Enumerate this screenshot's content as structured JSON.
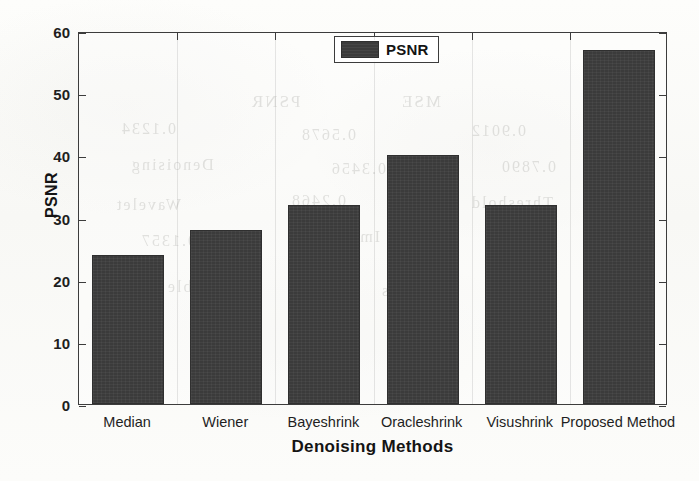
{
  "chart_data": {
    "type": "bar",
    "title": "",
    "xlabel": "Denoising Methods",
    "ylabel": "PSNR",
    "categories": [
      "Median",
      "Wiener",
      "Bayeshrink",
      "Oracleshrink",
      "Visushrink",
      "Proposed Method"
    ],
    "values": [
      24,
      28,
      32,
      40,
      32,
      57
    ],
    "series": [
      {
        "name": "PSNR",
        "values": [
          24,
          28,
          32,
          40,
          32,
          57
        ],
        "color": "#3b3b3b"
      }
    ],
    "ylim": [
      0,
      60
    ],
    "yticks": [
      0,
      10,
      20,
      30,
      40,
      50,
      60
    ],
    "ytick_labels": [
      "0",
      "10",
      "20",
      "30",
      "40",
      "50",
      "60"
    ],
    "grid": "vertical-light",
    "legend": {
      "position": "top-center",
      "entries": [
        {
          "label": "PSNR",
          "color": "#3b3b3b"
        }
      ]
    }
  },
  "legend": {
    "label": "PSNR"
  },
  "axes": {
    "x_title": "Denoising Methods",
    "y_title": "PSNR"
  },
  "background_bleed": [
    {
      "text": "PSNR",
      "x": 250,
      "y": 92,
      "size": 17
    },
    {
      "text": "MSE",
      "x": 400,
      "y": 92,
      "size": 17
    },
    {
      "text": "0.1234",
      "x": 120,
      "y": 120,
      "size": 16
    },
    {
      "text": "0.5678",
      "x": 300,
      "y": 126,
      "size": 16
    },
    {
      "text": "0.9012",
      "x": 470,
      "y": 122,
      "size": 16
    },
    {
      "text": "Denoising",
      "x": 130,
      "y": 156,
      "size": 16
    },
    {
      "text": "0.3456",
      "x": 330,
      "y": 160,
      "size": 16
    },
    {
      "text": "0.7890",
      "x": 500,
      "y": 158,
      "size": 16
    },
    {
      "text": "Wavelet",
      "x": 115,
      "y": 196,
      "size": 16
    },
    {
      "text": "0.2468",
      "x": 290,
      "y": 192,
      "size": 16
    },
    {
      "text": "Threshold",
      "x": 470,
      "y": 194,
      "size": 16
    },
    {
      "text": "0.1357",
      "x": 140,
      "y": 232,
      "size": 16
    },
    {
      "text": "Image",
      "x": 330,
      "y": 228,
      "size": 16
    },
    {
      "text": "0.8642",
      "x": 490,
      "y": 230,
      "size": 16
    },
    {
      "text": "Table 2",
      "x": 150,
      "y": 278,
      "size": 16
    },
    {
      "text": "Results",
      "x": 380,
      "y": 282,
      "size": 16
    }
  ]
}
